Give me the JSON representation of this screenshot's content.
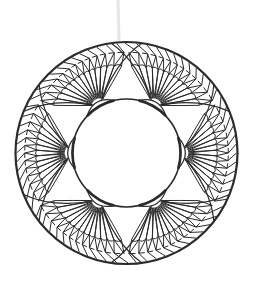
{
  "image": {
    "title": "Circular floral ring line art",
    "width": 253,
    "height": 287,
    "background": "#ffffff"
  },
  "ornament": {
    "center": [
      126.5,
      153
    ],
    "outer_radius": 111,
    "inner_radius": 54,
    "line_color": "#2b2b2b",
    "outer_stroke": 2.2,
    "inner_stroke": 1.6,
    "detail_stroke": 1.0,
    "fan_count": 6,
    "fan_angles_deg": [
      0,
      60,
      120,
      180,
      240,
      300
    ],
    "petals_per_fan": 13,
    "fan_spread_deg": 128,
    "cap": {
      "half_angle_deg": 17,
      "thickness": 6
    },
    "smudge": {
      "x": 118,
      "y1": 0,
      "y2": 40,
      "color": "#e6e6e6"
    }
  }
}
